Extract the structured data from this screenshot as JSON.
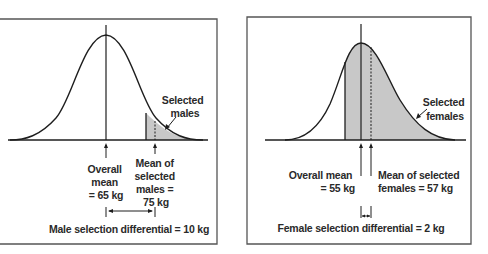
{
  "panels": [
    {
      "id": "male",
      "overall_mean_lines": [
        "Overall",
        "mean",
        "= 65 kg"
      ],
      "selected_mean_lines": [
        "Mean of",
        "selected",
        "males =",
        "75 kg"
      ],
      "selected_label_lines": [
        "Selected",
        "males"
      ],
      "differential_label": "Male selection differential = 10 kg"
    },
    {
      "id": "female",
      "overall_mean_lines": [
        "Overall mean",
        "= 55 kg"
      ],
      "selected_mean_lines": [
        "Mean of selected",
        "females = 57 kg"
      ],
      "selected_label_lines": [
        "Selected",
        "females"
      ],
      "differential_label": "Female selection differential = 2 kg"
    }
  ],
  "colors": {
    "line": "#1e1e1e",
    "shade": "#c8c8c8",
    "border": "#555555"
  }
}
